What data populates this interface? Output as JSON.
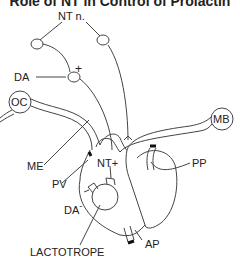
{
  "title": "Role of NT in Control of Prolactin",
  "labels": {
    "nt_nucleus": "NT n.",
    "da": "DA",
    "plus": "+",
    "oc": "OC",
    "mb": "MB",
    "me": "ME",
    "pv": "PV",
    "nt_plus": "NT+",
    "pp": "PP",
    "da_minus": "DA",
    "minus": "-",
    "ap": "AP",
    "lactotrope": "LACTOTROPE"
  },
  "colors": {
    "stroke": "#444444",
    "text": "#222222",
    "background": "#ffffff",
    "vessel_end": "#111111"
  }
}
